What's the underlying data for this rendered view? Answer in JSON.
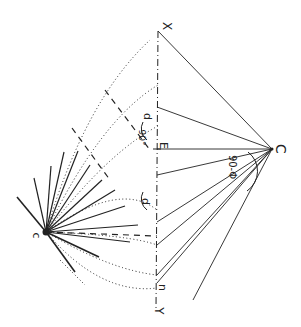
{
  "diagram": {
    "title": "",
    "rotation_deg": 90,
    "stroke_color": "#222222",
    "points": {
      "X": {
        "x": 158,
        "y": 31
      },
      "Y": {
        "x": 156,
        "y": 310
      },
      "C": {
        "x": 272,
        "y": 149
      },
      "c": {
        "x": 46,
        "y": 232
      },
      "E": {
        "x": 157,
        "y": 149
      },
      "n": {
        "x": 156,
        "y": 285
      }
    },
    "labels": {
      "X": "X",
      "Y": "Y",
      "C": "C",
      "c": "c",
      "E": "E",
      "n": "n",
      "d_upper": "d",
      "d_lower": "d",
      "angle_90": "90°",
      "angle_90_phi": "90-Φ"
    },
    "axis_xy": {
      "style": "dash-dot",
      "from": "X",
      "to": "Y"
    },
    "solid_from_C": [
      {
        "x": 158,
        "y": 31
      },
      {
        "x": 157,
        "y": 107
      },
      {
        "x": 157,
        "y": 149
      },
      {
        "x": 157,
        "y": 175
      },
      {
        "x": 157,
        "y": 222
      },
      {
        "x": 157,
        "y": 245
      },
      {
        "x": 157,
        "y": 275
      },
      {
        "x": 157,
        "y": 283
      },
      {
        "x": 193,
        "y": 300
      }
    ],
    "fan_from_c": [
      {
        "x": 17,
        "y": 197,
        "w": 1.6
      },
      {
        "x": 34,
        "y": 178,
        "w": 1.2
      },
      {
        "x": 51,
        "y": 166,
        "w": 1.2
      },
      {
        "x": 64,
        "y": 152,
        "w": 1.2
      },
      {
        "x": 78,
        "y": 151,
        "w": 1.2
      },
      {
        "x": 90,
        "y": 165,
        "w": 1.2
      },
      {
        "x": 102,
        "y": 180,
        "w": 1.2
      },
      {
        "x": 115,
        "y": 190,
        "w": 1.2
      },
      {
        "x": 125,
        "y": 206,
        "w": 1.2
      },
      {
        "x": 138,
        "y": 225,
        "w": 1.2
      },
      {
        "x": 130,
        "y": 242,
        "w": 1.2
      },
      {
        "x": 99,
        "y": 257,
        "w": 1.6
      },
      {
        "x": 75,
        "y": 272,
        "w": 1.6
      }
    ],
    "dotted_arcs": [
      {
        "path": "M46 232 Q110 150 160 125"
      },
      {
        "path": "M46 232 Q100 120 158 85"
      },
      {
        "path": "M46 232 Q85 100 150 40"
      },
      {
        "path": "M46 232 Q120 180 157 210"
      },
      {
        "path": "M46 232 Q130 235 157 245"
      },
      {
        "path": "M46 232 Q110 270 157 275"
      },
      {
        "path": "M46 232 Q100 295 157 288"
      },
      {
        "path": "M60 260 L85 285"
      }
    ],
    "dashed_lines": [
      {
        "x1": 105,
        "y1": 90,
        "x2": 150,
        "y2": 150
      },
      {
        "x1": 72,
        "y1": 128,
        "x2": 110,
        "y2": 180
      },
      {
        "x1": 46,
        "y1": 232,
        "x2": 157,
        "y2": 236
      }
    ],
    "arcs": [
      {
        "path": "M248 152 A24 24 0 0 1 247 191",
        "label": "90-Φ"
      },
      {
        "path": "M143 122 A14 14 0 0 0 147 140",
        "label": "d"
      },
      {
        "path": "M143 192 A14 14 0 0 0 147 210",
        "label": "d"
      }
    ]
  }
}
